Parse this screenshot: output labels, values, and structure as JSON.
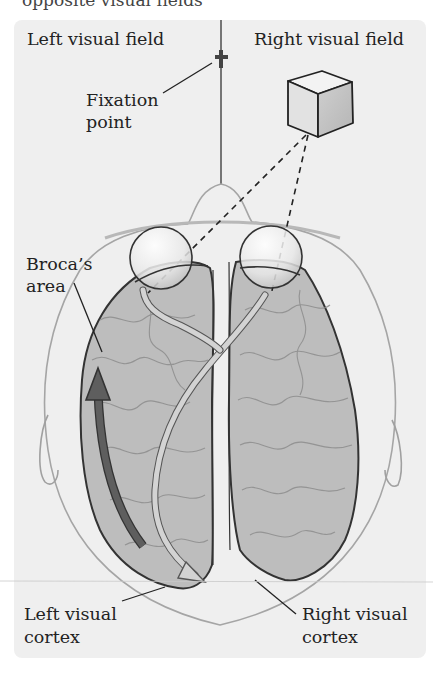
{
  "figure": {
    "cropped_heading": "opposite visual fields",
    "labels": {
      "left_visual_field": "Left visual field",
      "right_visual_field": "Right visual field",
      "fixation_point_line1": "Fixation",
      "fixation_point_line2": "point",
      "brocas_area_line1": "Broca’s",
      "brocas_area_line2": "area",
      "left_visual_cortex_line1": "Left visual",
      "left_visual_cortex_line2": "cortex",
      "right_visual_cortex_line1": "Right visual",
      "right_visual_cortex_line2": "cortex"
    },
    "icons": [
      "fixation-cross",
      "cube-stimulus",
      "left-eye",
      "right-eye",
      "brain-left-hemisphere",
      "brain-right-hemisphere",
      "optic-pathway-arrow",
      "broca-arrow"
    ],
    "colors": {
      "panel_bg": "#efefef",
      "brain_fill": "#bdbdbd",
      "brain_outline": "#333333",
      "broca_arrow": "#555555",
      "pathway_fill": "#cfcfcf",
      "head_outline": "#a0a0a0"
    }
  }
}
